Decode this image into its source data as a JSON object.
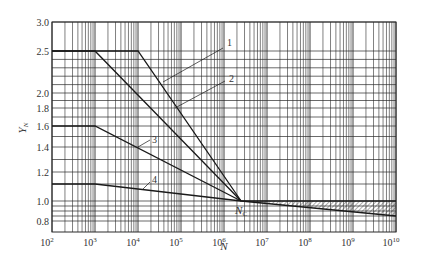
{
  "chart_data": {
    "type": "line",
    "title": "",
    "xlabel": "N",
    "ylabel": "Y_N",
    "xscale": "log",
    "xlim": [
      100,
      10000000000
    ],
    "ylim": [
      0.75,
      3.0
    ],
    "grid": true,
    "x_tick_labels": [
      {
        "base": "10",
        "exp": "2"
      },
      {
        "base": "10",
        "exp": "3"
      },
      {
        "base": "10",
        "exp": "4"
      },
      {
        "base": "10",
        "exp": "5"
      },
      {
        "base": "10",
        "exp": "6"
      },
      {
        "base": "10",
        "exp": "7"
      },
      {
        "base": "10",
        "exp": "8"
      },
      {
        "base": "10",
        "exp": "9"
      },
      {
        "base": "10",
        "exp": "10"
      }
    ],
    "y_tick_labels": [
      "3.0",
      "2.5",
      "2.0",
      "1.8",
      "1.6",
      "1.4",
      "1.2",
      "1.0",
      "0.8"
    ],
    "y_tick_values": [
      3.0,
      2.5,
      2.0,
      1.8,
      1.6,
      1.4,
      1.2,
      1.0,
      0.8
    ],
    "y_extra_gridlines": [
      2.4,
      2.3,
      2.2,
      2.1,
      1.9,
      1.7,
      1.5,
      1.3,
      1.1,
      0.95,
      0.9,
      0.85
    ],
    "convergence_point": {
      "label": "N",
      "sub": "C",
      "N": 2500000,
      "Y": 1.0
    },
    "series": [
      {
        "name": "1",
        "points": [
          [
            100,
            2.5
          ],
          [
            10000,
            2.5
          ],
          [
            2500000,
            1.0
          ]
        ]
      },
      {
        "name": "2",
        "points": [
          [
            100,
            2.5
          ],
          [
            1000,
            2.5
          ],
          [
            2500000,
            1.0
          ]
        ]
      },
      {
        "name": "3",
        "points": [
          [
            100,
            1.6
          ],
          [
            1000,
            1.6
          ],
          [
            2500000,
            1.0
          ]
        ]
      },
      {
        "name": "4",
        "points": [
          [
            100,
            1.1
          ],
          [
            1000,
            1.1
          ],
          [
            2500000,
            1.0
          ]
        ]
      },
      {
        "name": "upper-bound",
        "points": [
          [
            2500000,
            1.0
          ],
          [
            10000000000,
            1.0
          ]
        ]
      },
      {
        "name": "lower-bound",
        "points": [
          [
            2500000,
            1.0
          ],
          [
            10000000000,
            0.85
          ]
        ]
      }
    ],
    "hatched_region": {
      "between": [
        "upper-bound",
        "lower-bound"
      ],
      "x_range": [
        2500000,
        10000000000
      ]
    },
    "annotations": [
      {
        "text": "1",
        "leader_from": [
          163,
          82
        ],
        "leader_to": [
          223,
          48
        ],
        "at": [
          227,
          46
        ]
      },
      {
        "text": "2",
        "leader_from": [
          175,
          108
        ],
        "leader_to": [
          225,
          81
        ],
        "at": [
          229,
          82
        ]
      },
      {
        "text": "3",
        "leader_from": [
          138,
          147
        ],
        "leader_to": [
          150,
          140
        ],
        "at": [
          152,
          143
        ]
      },
      {
        "text": "4",
        "leader_from": [
          143,
          189
        ],
        "leader_to": [
          150,
          182
        ],
        "at": [
          152,
          183
        ]
      }
    ]
  },
  "colors": {
    "line": "#1a1a1a",
    "grid": "#2a2a2a",
    "text": "#333333",
    "background": "#ffffff"
  }
}
